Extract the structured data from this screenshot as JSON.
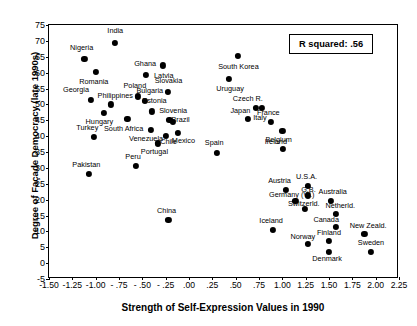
{
  "chart_data": {
    "type": "scatter",
    "title": "",
    "xlabel": "Strength of Self-Expression Values in 1990",
    "ylabel": "Degree of Façade Democracy (late 1990s)",
    "xlim": [
      -1.5,
      2.25
    ],
    "ylim": [
      -5,
      75
    ],
    "xticks": [
      "-1.50",
      "-1.25",
      "-1.00",
      "- .75",
      "- .50",
      "- .25",
      ".00",
      ".25",
      ".50",
      ".75",
      "1.00",
      "1.25",
      "1.50",
      "1.75",
      "2.00",
      "2.25"
    ],
    "xtick_values": [
      -1.5,
      -1.25,
      -1.0,
      -0.75,
      -0.5,
      -0.25,
      0.0,
      0.25,
      0.5,
      0.75,
      1.0,
      1.25,
      1.5,
      1.75,
      2.0,
      2.25
    ],
    "yticks": [
      "-5",
      "0",
      "5",
      "10",
      "15",
      "20",
      "25",
      "30",
      "35",
      "40",
      "45",
      "50",
      "55",
      "60",
      "65",
      "70",
      "75"
    ],
    "ytick_values": [
      -5,
      0,
      5,
      10,
      15,
      20,
      25,
      30,
      35,
      40,
      45,
      50,
      55,
      60,
      65,
      70,
      75
    ],
    "grid": false,
    "legend": null,
    "annotation": "R squared:  .56",
    "marker_color": "#000000",
    "points": [
      {
        "label": "India",
        "x": -0.79,
        "y": 69.3,
        "lx": -0.79,
        "ly": 73.0
      },
      {
        "label": "Nigeria",
        "x": -1.12,
        "y": 64.3,
        "lx": -1.15,
        "ly": 67.6
      },
      {
        "label": "Romania",
        "x": -1.0,
        "y": 60.2,
        "lx": -1.02,
        "ly": 57.0
      },
      {
        "label": "Ghana",
        "x": -0.46,
        "y": 59.2,
        "lx": -0.47,
        "ly": 62.6
      },
      {
        "label": "Latvia",
        "x": -0.28,
        "y": 62.3,
        "lx": -0.27,
        "ly": 58.9
      },
      {
        "label": "South Korea",
        "x": 0.52,
        "y": 65.2,
        "lx": 0.53,
        "ly": 61.8
      },
      {
        "label": "Slovakia",
        "x": -0.23,
        "y": 53.9,
        "lx": -0.22,
        "ly": 57.3
      },
      {
        "label": "Georgia",
        "x": -1.05,
        "y": 51.4,
        "lx": -1.21,
        "ly": 54.4
      },
      {
        "label": "Poland",
        "x": -0.55,
        "y": 52.5,
        "lx": -0.58,
        "ly": 55.7
      },
      {
        "label": "Philippines",
        "x": -0.84,
        "y": 50.0,
        "lx": -0.79,
        "ly": 52.7
      },
      {
        "label": "Bulgaria",
        "x": -0.47,
        "y": 51.0,
        "lx": -0.42,
        "ly": 54.1
      },
      {
        "label": "Uruguay",
        "x": 0.43,
        "y": 58.1,
        "lx": 0.44,
        "ly": 54.7
      },
      {
        "label": "Estonia",
        "x": -0.4,
        "y": 47.8,
        "lx": -0.37,
        "ly": 51.0
      },
      {
        "label": "Czech R.",
        "x": 0.72,
        "y": 48.8,
        "lx": 0.63,
        "ly": 51.6
      },
      {
        "label": "Slovenia",
        "x": -0.21,
        "y": 45.1,
        "lx": -0.17,
        "ly": 47.9
      },
      {
        "label": "Japan",
        "x": 0.63,
        "y": 45.3,
        "lx": 0.55,
        "ly": 48.0
      },
      {
        "label": "Italy",
        "x": 0.78,
        "y": 48.8,
        "lx": 0.76,
        "ly": 45.6
      },
      {
        "label": "Hungary",
        "x": -0.91,
        "y": 47.4,
        "lx": -0.96,
        "ly": 44.5
      },
      {
        "label": "South Africa",
        "x": -0.66,
        "y": 45.4,
        "lx": -0.7,
        "ly": 42.4
      },
      {
        "label": "Brazil",
        "x": -0.17,
        "y": 44.5,
        "lx": -0.09,
        "ly": 45.2
      },
      {
        "label": "France",
        "x": 0.88,
        "y": 44.4,
        "lx": 0.85,
        "ly": 47.3
      },
      {
        "label": "Turkey",
        "x": -1.02,
        "y": 39.8,
        "lx": -1.09,
        "ly": 42.6
      },
      {
        "label": "Venezuela",
        "x": -0.41,
        "y": 42.0,
        "lx": -0.46,
        "ly": 39.2
      },
      {
        "label": "Chile",
        "x": -0.25,
        "y": 40.0,
        "lx": -0.22,
        "ly": 38.1
      },
      {
        "label": "Mexico",
        "x": -0.12,
        "y": 41.1,
        "lx": -0.06,
        "ly": 38.6
      },
      {
        "label": "Belgium",
        "x": 1.0,
        "y": 41.6,
        "lx": 0.96,
        "ly": 38.9
      },
      {
        "label": "Ireland",
        "x": 1.01,
        "y": 36.1,
        "lx": 0.93,
        "ly": 38.3
      },
      {
        "label": "Portugal",
        "x": -0.33,
        "y": 37.7,
        "lx": -0.37,
        "ly": 35.0
      },
      {
        "label": "Spain",
        "x": 0.3,
        "y": 34.8,
        "lx": 0.27,
        "ly": 37.7
      },
      {
        "label": "Peru",
        "x": -0.57,
        "y": 30.7,
        "lx": -0.6,
        "ly": 33.4
      },
      {
        "label": "Pakistan",
        "x": -1.07,
        "y": 28.1,
        "lx": -1.1,
        "ly": 30.8
      },
      {
        "label": "Austria",
        "x": 1.04,
        "y": 23.1,
        "lx": 0.97,
        "ly": 26.0
      },
      {
        "label": "U.S.A.",
        "x": 1.27,
        "y": 24.3,
        "lx": 1.26,
        "ly": 27.0
      },
      {
        "label": "G.B.",
        "x": 1.27,
        "y": 21.3,
        "lx": 1.28,
        "ly": 22.9
      },
      {
        "label": "Germany (W.)",
        "x": 1.14,
        "y": 19.6,
        "lx": 1.1,
        "ly": 21.5
      },
      {
        "label": "Australia",
        "x": 1.52,
        "y": 19.6,
        "lx": 1.54,
        "ly": 22.3
      },
      {
        "label": "Switzerld.",
        "x": 1.24,
        "y": 17.0,
        "lx": 1.23,
        "ly": 18.7
      },
      {
        "label": "Netherld.",
        "x": 1.57,
        "y": 15.6,
        "lx": 1.62,
        "ly": 18.0
      },
      {
        "label": "China",
        "x": -0.22,
        "y": 13.5,
        "lx": -0.24,
        "ly": 16.3
      },
      {
        "label": "Iceland",
        "x": 0.9,
        "y": 10.5,
        "lx": 0.88,
        "ly": 13.3
      },
      {
        "label": "Canada",
        "x": 1.57,
        "y": 11.5,
        "lx": 1.47,
        "ly": 13.5
      },
      {
        "label": "New Zeald.",
        "x": 1.88,
        "y": 9.1,
        "lx": 1.92,
        "ly": 11.6
      },
      {
        "label": "Norway",
        "x": 1.27,
        "y": 6.1,
        "lx": 1.22,
        "ly": 8.3
      },
      {
        "label": "Finland",
        "x": 1.5,
        "y": 7.0,
        "lx": 1.5,
        "ly": 9.6
      },
      {
        "label": "Sweden",
        "x": 1.95,
        "y": 3.6,
        "lx": 1.95,
        "ly": 6.2
      },
      {
        "label": "Denmark",
        "x": 1.5,
        "y": 3.6,
        "lx": 1.48,
        "ly": 1.2
      }
    ]
  }
}
